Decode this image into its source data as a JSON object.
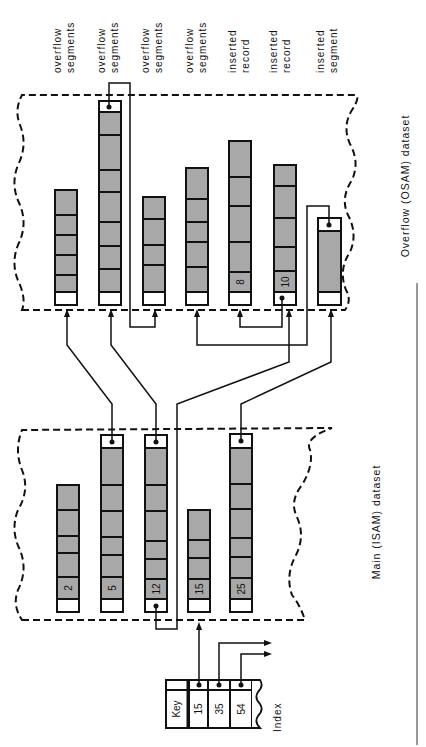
{
  "diagram": {
    "orientation": "rotated 90° counter-clockwise",
    "overflow_labels": [
      {
        "line1": "overflow",
        "line2": "segments"
      },
      {
        "line1": "overflow",
        "line2": "segments"
      },
      {
        "line1": "overflow",
        "line2": "segments"
      },
      {
        "line1": "overflow",
        "line2": "segments"
      },
      {
        "line1": "inserted",
        "line2": "record"
      },
      {
        "line1": "inserted",
        "line2": "record"
      },
      {
        "line1": "inserted",
        "line2": "segment"
      }
    ],
    "main_dataset": {
      "title": "Main (ISAM) dataset",
      "records": [
        {
          "key": "2",
          "has_pointer": false
        },
        {
          "key": "5",
          "has_pointer": true
        },
        {
          "key": "12",
          "has_pointer": true
        },
        {
          "key": "15",
          "has_pointer": false
        },
        {
          "key": "25",
          "has_pointer": true
        }
      ]
    },
    "overflow_dataset": {
      "title": "Overflow (OSAM) dataset",
      "records": [
        {
          "label": ""
        },
        {
          "label": ""
        },
        {
          "label": ""
        },
        {
          "label": ""
        },
        {
          "label": "8"
        },
        {
          "label": "10"
        },
        {
          "label": ""
        }
      ]
    },
    "index": {
      "title": "Index",
      "header": "Key",
      "keys": [
        "15",
        "35",
        "54"
      ]
    },
    "colors": {
      "segment_fill": "#a8a8a8",
      "line": "#111111",
      "background": "#ffffff"
    }
  }
}
